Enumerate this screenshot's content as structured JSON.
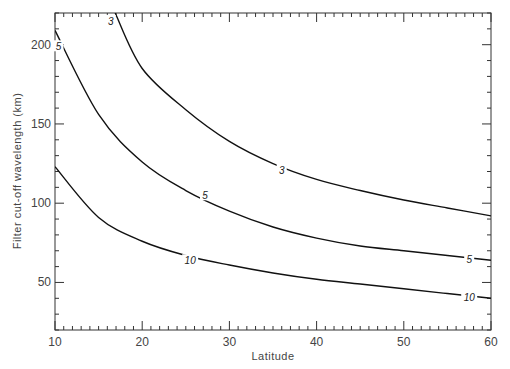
{
  "chart_data": {
    "type": "line",
    "title": "",
    "xlabel": "Latitude",
    "ylabel": "Filter cut-off wavelength (km)",
    "xlim": [
      10,
      60
    ],
    "ylim": [
      20,
      220
    ],
    "xticks": [
      10,
      20,
      30,
      40,
      50,
      60
    ],
    "yticks": [
      50,
      100,
      150,
      200
    ],
    "x_minor_step": 1,
    "y_minor_step": 10,
    "grid": false,
    "legend": null,
    "series": [
      {
        "name": "3",
        "x": [
          16.9,
          20,
          25,
          30,
          35,
          40,
          45,
          50,
          55,
          60
        ],
        "y": [
          220,
          185,
          159,
          139,
          125,
          115,
          108,
          102,
          97,
          92
        ],
        "label_at": [
          36,
          121
        ]
      },
      {
        "name": "5",
        "x": [
          10,
          15,
          20,
          25,
          30,
          35,
          40,
          45,
          50,
          55,
          60
        ],
        "y": [
          209,
          156,
          126,
          108,
          95,
          85,
          78,
          73,
          70,
          67,
          64
        ],
        "label_at": [
          27.2,
          105
        ]
      },
      {
        "name": "10",
        "x": [
          10,
          15,
          20,
          25,
          30,
          35,
          40,
          45,
          50,
          55,
          60
        ],
        "y": [
          123,
          91,
          76,
          67,
          61,
          56,
          52,
          49,
          46,
          43,
          40
        ],
        "label_at": [
          25.5,
          64
        ]
      }
    ],
    "annotations": [
      {
        "text": "3",
        "x": 16.4,
        "y": 215
      },
      {
        "text": "5",
        "x": 10.4,
        "y": 199
      },
      {
        "text": "5",
        "x": 57.5,
        "y": 65
      },
      {
        "text": "10",
        "x": 57.5,
        "y": 41
      }
    ]
  }
}
